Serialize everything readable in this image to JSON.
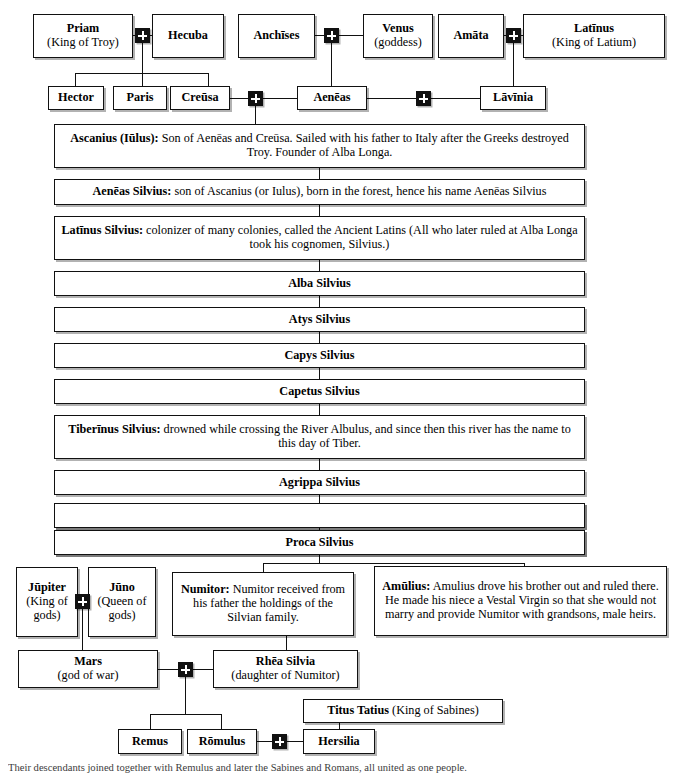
{
  "diagram": {
    "generation_1": [
      {
        "id": "priam",
        "name": "Priam",
        "detail": "(King of Troy)"
      },
      {
        "id": "hecuba",
        "name": "Hecuba",
        "detail": ""
      },
      {
        "id": "anchises",
        "name": "Anchīses",
        "detail": ""
      },
      {
        "id": "venus",
        "name": "Venus",
        "detail": "(goddess)"
      },
      {
        "id": "amata",
        "name": "Amāta",
        "detail": ""
      },
      {
        "id": "latinus",
        "name": "Latīnus",
        "detail": "(King of Latium)"
      }
    ],
    "generation_2": [
      {
        "id": "hector",
        "name": "Hector",
        "detail": ""
      },
      {
        "id": "paris",
        "name": "Paris",
        "detail": ""
      },
      {
        "id": "creusa",
        "name": "Creūsa",
        "detail": ""
      },
      {
        "id": "aeneas",
        "name": "Aenēas",
        "detail": ""
      },
      {
        "id": "lavinia",
        "name": "Lāvīnia",
        "detail": ""
      }
    ],
    "silvian_line": [
      {
        "id": "ascanius",
        "name": "Ascanius (Iūlus):",
        "desc": " Son of Aenēas and Creūsa. Sailed with his father to Italy after the Greeks destroyed Troy. Founder of Alba Longa."
      },
      {
        "id": "aeneas-silvius",
        "name": "Aenēas Silvius:",
        "desc": " son of Ascanius (or Iulus), born in the forest, hence his name Aenēas Silvius"
      },
      {
        "id": "latinus-silvius",
        "name": "Latīnus Silvius:",
        "desc": " colonizer of many colonies, called the Ancient Latins (All who later ruled at Alba Longa took his cognomen, Silvius.)"
      },
      {
        "id": "alba-silvius",
        "name": "Alba Silvius",
        "desc": ""
      },
      {
        "id": "atys-silvius",
        "name": "Atys Silvius",
        "desc": ""
      },
      {
        "id": "capys-silvius",
        "name": "Capys Silvius",
        "desc": ""
      },
      {
        "id": "capetus-silvius",
        "name": "Capetus Silvius",
        "desc": ""
      },
      {
        "id": "tiberinus-silvius",
        "name": "Tiberīnus Silvius:",
        "desc": " drowned while crossing the River Albulus, and since then this river has the name to this day of Tiber."
      },
      {
        "id": "agrippa-silvius",
        "name": "Agrippa Silvius",
        "desc": ""
      },
      {
        "id": "romulus-silvius",
        "name": "Rōmulus Silvius:",
        "desc": " killed by lightning"
      },
      {
        "id": "aventinus-silvius",
        "name": "Aventīnus Silvius:",
        "desc": " buried on the hill which still bears his name"
      },
      {
        "id": "proca-silvius",
        "name": "Proca Silvius",
        "desc": ""
      }
    ],
    "gods_row": [
      {
        "id": "jupiter",
        "name": "Jūpiter",
        "detail": "(King of gods)"
      },
      {
        "id": "juno",
        "name": "Jūno",
        "detail": "(Queen of gods)"
      }
    ],
    "proca_sons": [
      {
        "id": "numitor",
        "name": "Numitor:",
        "desc": " Numitor received from his father the holdings of the Silvian family."
      },
      {
        "id": "amulius",
        "name": "Amūlius:",
        "desc": " Amulius drove his brother out and ruled there. He made his niece a Vestal Virgin so that she would not marry and provide Numitor with grandsons, male heirs."
      }
    ],
    "parents_row": [
      {
        "id": "mars",
        "name": "Mars",
        "detail": "(god of war)"
      },
      {
        "id": "rhea-silvia",
        "name": "Rhēa Silvia",
        "detail": "(daughter of Numitor)"
      }
    ],
    "sabine": {
      "id": "titus-tatius",
      "name": "Titus Tatius",
      "detail": " (King of Sabines)"
    },
    "founders_row": [
      {
        "id": "remus",
        "name": "Remus",
        "detail": ""
      },
      {
        "id": "romulus",
        "name": "Rōmulus",
        "detail": ""
      },
      {
        "id": "hersilia",
        "name": "Hersilia",
        "detail": ""
      }
    ],
    "caption": "Their descendants joined together with Remulus and later the Sabines and Romans, all united as one people.",
    "colors": {
      "line": "#111111",
      "box_fill": "#ffffff",
      "marriage_node": "#111111"
    }
  }
}
